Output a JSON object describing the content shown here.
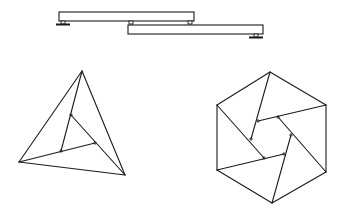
{
  "diagram": {
    "stroke_color": "#1a1a1a",
    "background": "#ffffff",
    "beams": {
      "upper_beam": {
        "x": 59,
        "y": 12,
        "w": 135,
        "h": 9
      },
      "lower_beam": {
        "x": 128,
        "y": 25,
        "w": 135,
        "h": 9
      },
      "supports": [
        {
          "name": "left-ground-support",
          "x": 63,
          "y": 21
        },
        {
          "name": "middle-pin-support",
          "x": 131,
          "y": 21
        },
        {
          "name": "upper-right-pin-support",
          "x": 190,
          "y": 21
        },
        {
          "name": "right-ground-support",
          "x": 256,
          "y": 34
        }
      ]
    },
    "triangle": {
      "outer": [
        [
          82,
          71
        ],
        [
          19,
          162
        ],
        [
          125,
          175
        ]
      ],
      "inner": [
        [
          71,
          115
        ],
        [
          61,
          151
        ],
        [
          95,
          143
        ]
      ]
    },
    "hexagon": {
      "outer": [
        [
          270,
          72
        ],
        [
          326,
          105
        ],
        [
          326,
          172
        ],
        [
          272,
          203
        ],
        [
          217,
          170
        ],
        [
          217,
          105
        ]
      ],
      "inner": [
        [
          258,
          121
        ],
        [
          278,
          117
        ],
        [
          291,
          135
        ],
        [
          284,
          154
        ],
        [
          264,
          158
        ],
        [
          251,
          139
        ]
      ]
    }
  }
}
